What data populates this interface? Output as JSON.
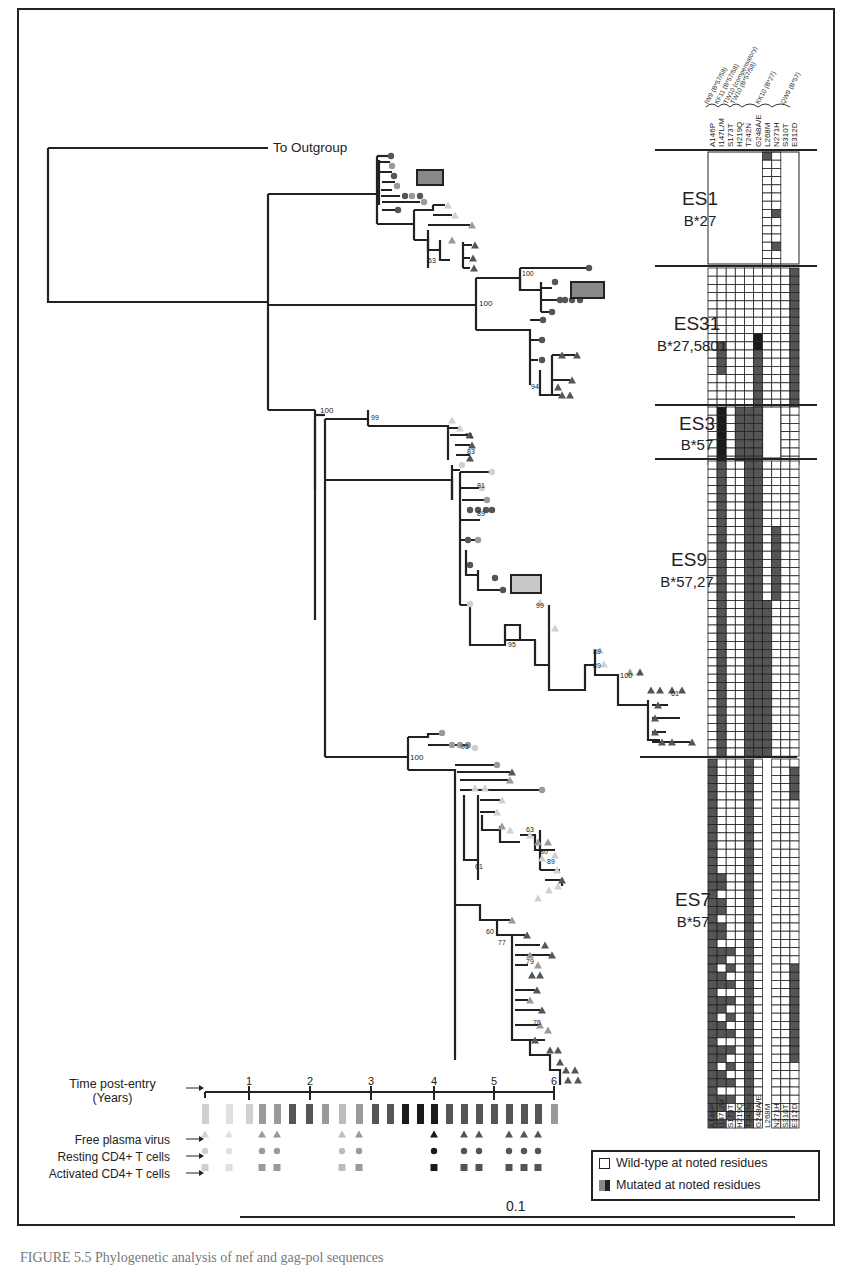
{
  "figure": {
    "outgroup_label": "To Outgroup",
    "scale_bar_label": "0.1",
    "caption": "FIGURE 5.5   Phylogenetic analysis of nef and gag-pol sequences"
  },
  "epitope_header": {
    "groups": [
      "IW9 (B*57/58)",
      "KF11 (B*57/58)",
      "TW10 (compensatory)",
      "TW10 (B*57/58)",
      "KK10 (B*27)",
      "QW9 (B*57)"
    ],
    "residues": [
      "A146P",
      "I147L/M",
      "S173T",
      "H219Q",
      "T242N",
      "G248A/E",
      "L268M",
      "N271H",
      "S310T",
      "E312D"
    ]
  },
  "subjects": [
    {
      "id": "ES1",
      "hla": "B*27"
    },
    {
      "id": "ES31",
      "hla": "B*27,5801"
    },
    {
      "id": "ES3",
      "hla": "B*57"
    },
    {
      "id": "ES9",
      "hla": "B*57,27"
    },
    {
      "id": "ES7",
      "hla": "B*57"
    }
  ],
  "bootstrap_values": [
    "100",
    "100",
    "99",
    "100",
    "71",
    "83",
    "81",
    "89",
    "95",
    "99",
    "89",
    "89",
    "100",
    "61",
    "95",
    "100",
    "61",
    "63",
    "80",
    "89",
    "60",
    "77",
    "79",
    "76",
    "63",
    "94"
  ],
  "timeline": {
    "title_line1": "Time post-entry",
    "title_line2": "(Years)",
    "ticks": [
      "1",
      "2",
      "3",
      "4",
      "5",
      "6"
    ],
    "rows": [
      "Free plasma virus",
      "Resting CD4+ T cells",
      "Activated CD4+ T cells"
    ]
  },
  "legend": {
    "wild_type": "Wild-type at noted residues",
    "mutated": "Mutated at noted residues"
  },
  "colors": {
    "line": "#222222",
    "light": "#d0d0d0",
    "mid": "#9a9a9a",
    "dark": "#555555",
    "black": "#1a1a1a"
  }
}
